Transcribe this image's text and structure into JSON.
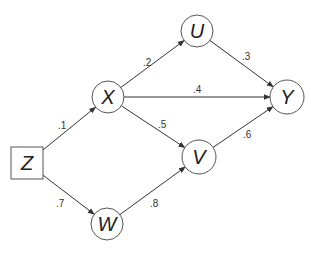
{
  "diagram": {
    "type": "path-diagram",
    "nodes": [
      {
        "id": "Z",
        "label": "Z",
        "shape": "square",
        "cx": 27,
        "cy": 163,
        "size": 32
      },
      {
        "id": "X",
        "label": "X",
        "shape": "circle",
        "cx": 108,
        "cy": 97,
        "r": 16
      },
      {
        "id": "W",
        "label": "W",
        "shape": "circle",
        "cx": 107,
        "cy": 224,
        "r": 16
      },
      {
        "id": "U",
        "label": "U",
        "shape": "circle",
        "cx": 197,
        "cy": 31,
        "r": 16
      },
      {
        "id": "V",
        "label": "V",
        "shape": "circle",
        "cx": 199,
        "cy": 157,
        "r": 17
      },
      {
        "id": "Y",
        "label": "Y",
        "shape": "circle",
        "cx": 287,
        "cy": 97,
        "r": 17
      }
    ],
    "edges": [
      {
        "from": "Z",
        "to": "X",
        "label": ".1",
        "lx": 58,
        "ly": 129
      },
      {
        "from": "Z",
        "to": "W",
        "label": ".7",
        "lx": 56,
        "ly": 207
      },
      {
        "from": "X",
        "to": "U",
        "label": ".2",
        "lx": 143,
        "ly": 66
      },
      {
        "from": "X",
        "to": "Y",
        "label": ".4",
        "lx": 193,
        "ly": 93
      },
      {
        "from": "X",
        "to": "V",
        "label": ".5",
        "lx": 158,
        "ly": 128
      },
      {
        "from": "W",
        "to": "V",
        "label": ".8",
        "lx": 150,
        "ly": 207
      },
      {
        "from": "U",
        "to": "Y",
        "label": ".3",
        "lx": 242,
        "ly": 60
      },
      {
        "from": "V",
        "to": "Y",
        "label": ".6",
        "lx": 243,
        "ly": 138
      }
    ]
  }
}
